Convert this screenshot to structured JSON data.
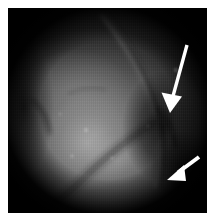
{
  "figure": {
    "kind": "endoscopic-photograph",
    "modality_label": "grayscale endoscopic still",
    "canvas": {
      "width": 213,
      "height": 222
    },
    "page_background": "#ffffff",
    "plate": {
      "x": 8,
      "y": 8,
      "width": 199,
      "height": 205,
      "background": "#000000"
    }
  },
  "image_content": {
    "field_of_view": "circular",
    "vignette": "dark corners, bright centre-left",
    "palette": {
      "highlight": "#c8c8c8",
      "midtone": "#7a7a7a",
      "shadow": "#2a2a2a",
      "black": "#000000",
      "annotation": "#ffffff"
    },
    "regions": [
      {
        "name": "bright-tissue-mass",
        "position": "centre-left",
        "tone": "#9a9a9a"
      },
      {
        "name": "curved-ridge",
        "position": "top-centre sweeping to lower-right",
        "tone": "#5e5e5e"
      },
      {
        "name": "dark-fold-crevice",
        "position": "right of centre",
        "tone": "#1a1a1a"
      },
      {
        "name": "lower-shadow",
        "position": "bottom",
        "tone": "#141414"
      }
    ]
  },
  "annotations": {
    "count": 2,
    "color": "#ffffff",
    "arrows": [
      {
        "id": "arrow-upper",
        "label": "upper-annotation-arrow",
        "direction": "down-left",
        "tail": {
          "x": 179,
          "y": 37
        },
        "tip": {
          "x": 162,
          "y": 104
        },
        "points_at": "dark-fold-crevice"
      },
      {
        "id": "arrow-lower",
        "label": "lower-annotation-arrow",
        "direction": "down-left",
        "tail": {
          "x": 191,
          "y": 149
        },
        "tip": {
          "x": 160,
          "y": 171
        },
        "points_at": "lower-right-lesion-margin"
      }
    ]
  }
}
